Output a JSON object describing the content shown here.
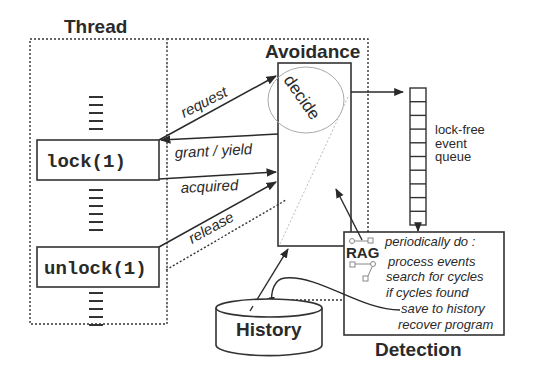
{
  "diagram": {
    "thread": {
      "title": "Thread",
      "lock_call": "lock(1)",
      "unlock_call": "unlock(1)"
    },
    "avoidance": {
      "title": "Avoidance",
      "decide_label": "decide"
    },
    "arrows": {
      "request": "request",
      "grant_yield": "grant / yield",
      "acquired": "acquired",
      "release": "release"
    },
    "queue": {
      "line1": "lock-free",
      "line2": "event",
      "line3": "queue",
      "slots": 10
    },
    "detection": {
      "title": "Detection",
      "rag_label": "RAG",
      "lines": [
        "periodically do :",
        "process events",
        "search for cycles",
        "if cycles found",
        "save to history",
        "recover program"
      ]
    },
    "history": {
      "label": "History"
    }
  }
}
